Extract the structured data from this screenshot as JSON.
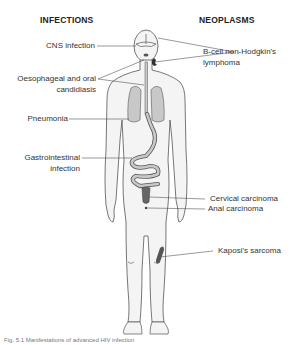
{
  "headers": {
    "left": "INFECTIONS",
    "right": "NEOPLASMS"
  },
  "infections": [
    {
      "id": "cns",
      "label": "CNS infection"
    },
    {
      "id": "oesophageal",
      "label_line1": "Oesophageal and oral",
      "label_line2": "candidiasis"
    },
    {
      "id": "pneumonia",
      "label": "Pneumonia"
    },
    {
      "id": "gi",
      "label_line1": "Gastrointestinal",
      "label_line2": "infection"
    }
  ],
  "neoplasms": [
    {
      "id": "lymphoma",
      "label_line1": "B-cell non-Hodgkin's",
      "label_line2": "lymphoma"
    },
    {
      "id": "cervical",
      "label": "Cervical carcinoma"
    },
    {
      "id": "anal",
      "label": "Anal carcinoma"
    },
    {
      "id": "kaposi",
      "label": "Kaposi's sarcoma"
    }
  ],
  "caption": "Fig. 5.1 Manifestations of advanced HIV infection",
  "colors": {
    "body_fill": "#f4f4f4",
    "outline": "#555555",
    "organ_fill": "#c8c8c8",
    "lesion_fill": "#555555",
    "leader_line": "#555555"
  }
}
